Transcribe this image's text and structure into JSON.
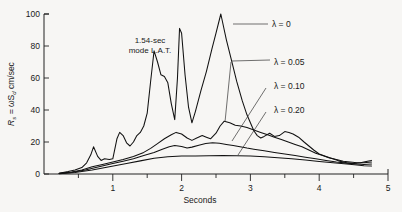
{
  "chart_data": {
    "type": "line",
    "title": "",
    "xlabel": "Seconds",
    "ylabel": "Rₛ = ωSᵈ  cm/sec",
    "xlim": [
      0,
      5
    ],
    "ylim": [
      0,
      100
    ],
    "xticks": [
      0,
      1,
      2,
      3,
      4,
      5
    ],
    "xticklabels": [
      "",
      "1",
      "2",
      "3",
      "4",
      "5"
    ],
    "yticks": [
      0,
      20,
      40,
      60,
      80,
      100
    ],
    "yticklabels": [
      "0",
      "20",
      "40",
      "60",
      "80",
      "100"
    ],
    "grid": false,
    "legend_position": "inline-annotations",
    "annotations": [
      {
        "id": "mode-note",
        "text_line1": "1.54-sec",
        "text_line2": "mode L.A.T."
      }
    ],
    "series": [
      {
        "name": "λ = 0",
        "label": "λ = 0",
        "points": [
          [
            0.22,
            0.5
          ],
          [
            0.35,
            1.5
          ],
          [
            0.45,
            2.5
          ],
          [
            0.55,
            4.0
          ],
          [
            0.62,
            7.0
          ],
          [
            0.68,
            12.0
          ],
          [
            0.72,
            17.0
          ],
          [
            0.78,
            11.0
          ],
          [
            0.83,
            8.5
          ],
          [
            0.88,
            9.5
          ],
          [
            0.95,
            9.0
          ],
          [
            1.0,
            9.5
          ],
          [
            1.06,
            22.0
          ],
          [
            1.1,
            26.0
          ],
          [
            1.15,
            24.0
          ],
          [
            1.2,
            19.5
          ],
          [
            1.25,
            17.5
          ],
          [
            1.3,
            20.0
          ],
          [
            1.35,
            24.0
          ],
          [
            1.4,
            26.0
          ],
          [
            1.45,
            30.0
          ],
          [
            1.5,
            38.0
          ],
          [
            1.55,
            58.0
          ],
          [
            1.6,
            77.0
          ],
          [
            1.65,
            70.0
          ],
          [
            1.7,
            62.0
          ],
          [
            1.75,
            61.0
          ],
          [
            1.8,
            57.0
          ],
          [
            1.85,
            44.0
          ],
          [
            1.9,
            34.0
          ],
          [
            1.94,
            60.0
          ],
          [
            1.97,
            91.0
          ],
          [
            2.0,
            88.0
          ],
          [
            2.05,
            62.0
          ],
          [
            2.1,
            42.0
          ],
          [
            2.15,
            32.0
          ],
          [
            2.2,
            39.0
          ],
          [
            2.28,
            52.0
          ],
          [
            2.36,
            64.0
          ],
          [
            2.44,
            78.0
          ],
          [
            2.5,
            88.0
          ],
          [
            2.57,
            100.0
          ],
          [
            2.65,
            84.0
          ],
          [
            2.72,
            72.0
          ],
          [
            2.8,
            58.0
          ],
          [
            2.88,
            46.0
          ],
          [
            2.95,
            37.0
          ],
          [
            3.0,
            32.0
          ],
          [
            3.05,
            27.0
          ],
          [
            3.1,
            24.0
          ],
          [
            3.15,
            22.5
          ],
          [
            3.2,
            23.5
          ],
          [
            3.28,
            25.5
          ],
          [
            3.35,
            23.5
          ],
          [
            3.42,
            24.0
          ],
          [
            3.5,
            26.5
          ],
          [
            3.56,
            26.0
          ],
          [
            3.62,
            25.0
          ],
          [
            3.7,
            23.0
          ],
          [
            3.78,
            20.0
          ],
          [
            3.85,
            17.5
          ],
          [
            3.92,
            15.0
          ],
          [
            4.0,
            12.5
          ],
          [
            4.1,
            11.0
          ],
          [
            4.2,
            9.5
          ],
          [
            4.3,
            8.0
          ],
          [
            4.4,
            7.0
          ],
          [
            4.5,
            6.5
          ],
          [
            4.6,
            7.0
          ],
          [
            4.7,
            8.0
          ],
          [
            4.76,
            8.5
          ]
        ]
      },
      {
        "name": "λ = 0.05",
        "label": "λ = 0.05",
        "points": [
          [
            0.22,
            0.4
          ],
          [
            0.4,
            1.2
          ],
          [
            0.55,
            2.5
          ],
          [
            0.7,
            4.5
          ],
          [
            0.85,
            6.0
          ],
          [
            1.0,
            7.5
          ],
          [
            1.15,
            9.0
          ],
          [
            1.3,
            11.0
          ],
          [
            1.45,
            13.5
          ],
          [
            1.55,
            16.0
          ],
          [
            1.65,
            19.0
          ],
          [
            1.75,
            22.0
          ],
          [
            1.85,
            24.5
          ],
          [
            1.92,
            26.0
          ],
          [
            2.0,
            25.0
          ],
          [
            2.08,
            22.5
          ],
          [
            2.15,
            21.0
          ],
          [
            2.22,
            22.5
          ],
          [
            2.3,
            24.0
          ],
          [
            2.36,
            23.0
          ],
          [
            2.42,
            22.0
          ],
          [
            2.5,
            25.5
          ],
          [
            2.56,
            30.0
          ],
          [
            2.62,
            33.0
          ],
          [
            2.7,
            32.0
          ],
          [
            2.78,
            30.5
          ],
          [
            2.86,
            30.0
          ],
          [
            2.95,
            29.0
          ],
          [
            3.05,
            27.5
          ],
          [
            3.15,
            26.0
          ],
          [
            3.25,
            24.5
          ],
          [
            3.35,
            23.0
          ],
          [
            3.45,
            21.5
          ],
          [
            3.55,
            20.0
          ],
          [
            3.65,
            18.5
          ],
          [
            3.75,
            17.0
          ],
          [
            3.85,
            15.0
          ],
          [
            3.95,
            13.0
          ],
          [
            4.05,
            11.5
          ],
          [
            4.15,
            10.0
          ],
          [
            4.25,
            9.0
          ],
          [
            4.35,
            8.0
          ],
          [
            4.45,
            7.5
          ],
          [
            4.55,
            7.0
          ],
          [
            4.65,
            7.0
          ],
          [
            4.76,
            7.5
          ]
        ]
      },
      {
        "name": "λ = 0.10",
        "label": "λ = 0.10",
        "points": [
          [
            0.22,
            0.3
          ],
          [
            0.4,
            1.0
          ],
          [
            0.6,
            2.5
          ],
          [
            0.8,
            4.5
          ],
          [
            1.0,
            6.5
          ],
          [
            1.15,
            8.0
          ],
          [
            1.3,
            9.5
          ],
          [
            1.45,
            11.5
          ],
          [
            1.6,
            13.5
          ],
          [
            1.72,
            15.5
          ],
          [
            1.82,
            17.0
          ],
          [
            1.9,
            17.8
          ],
          [
            2.0,
            17.2
          ],
          [
            2.08,
            16.2
          ],
          [
            2.15,
            16.8
          ],
          [
            2.25,
            18.0
          ],
          [
            2.35,
            19.0
          ],
          [
            2.45,
            19.5
          ],
          [
            2.55,
            19.2
          ],
          [
            2.65,
            18.5
          ],
          [
            2.75,
            17.8
          ],
          [
            2.85,
            17.0
          ],
          [
            2.95,
            16.2
          ],
          [
            3.05,
            15.5
          ],
          [
            3.2,
            14.5
          ],
          [
            3.35,
            13.5
          ],
          [
            3.5,
            12.5
          ],
          [
            3.65,
            11.5
          ],
          [
            3.8,
            10.5
          ],
          [
            3.95,
            9.5
          ],
          [
            4.1,
            8.5
          ],
          [
            4.25,
            7.5
          ],
          [
            4.4,
            6.8
          ],
          [
            4.55,
            6.2
          ],
          [
            4.65,
            6.0
          ],
          [
            4.76,
            6.2
          ]
        ]
      },
      {
        "name": "λ = 0.20",
        "label": "λ = 0.20",
        "points": [
          [
            0.22,
            0.2
          ],
          [
            0.45,
            1.0
          ],
          [
            0.7,
            2.5
          ],
          [
            0.95,
            4.5
          ],
          [
            1.2,
            6.5
          ],
          [
            1.4,
            8.2
          ],
          [
            1.6,
            9.8
          ],
          [
            1.8,
            10.8
          ],
          [
            2.0,
            11.2
          ],
          [
            2.2,
            11.3
          ],
          [
            2.4,
            11.4
          ],
          [
            2.6,
            11.5
          ],
          [
            2.8,
            11.4
          ],
          [
            3.0,
            11.2
          ],
          [
            3.2,
            10.8
          ],
          [
            3.4,
            10.2
          ],
          [
            3.6,
            9.5
          ],
          [
            3.8,
            8.7
          ],
          [
            4.0,
            7.8
          ],
          [
            4.2,
            7.0
          ],
          [
            4.4,
            6.2
          ],
          [
            4.55,
            5.6
          ],
          [
            4.65,
            5.2
          ],
          [
            4.76,
            5.0
          ]
        ]
      }
    ]
  },
  "axes": {
    "x_title": "Seconds",
    "y_title_parts": {
      "main": "R",
      "sub1": "s",
      "eq": " = ",
      "omega": "ωS",
      "sub2": "d",
      "units": "  cm/sec"
    }
  },
  "labels": {
    "mode_line1": "1.54-sec",
    "mode_line2": "mode L.A.T.",
    "lambda_0": "λ = 0",
    "lambda_005": "λ = 0.05",
    "lambda_010": "λ = 0.10",
    "lambda_020": "λ = 0.20"
  },
  "colors": {
    "background": "#f7f6f4",
    "ink": "#111111",
    "axis": "#222222"
  }
}
